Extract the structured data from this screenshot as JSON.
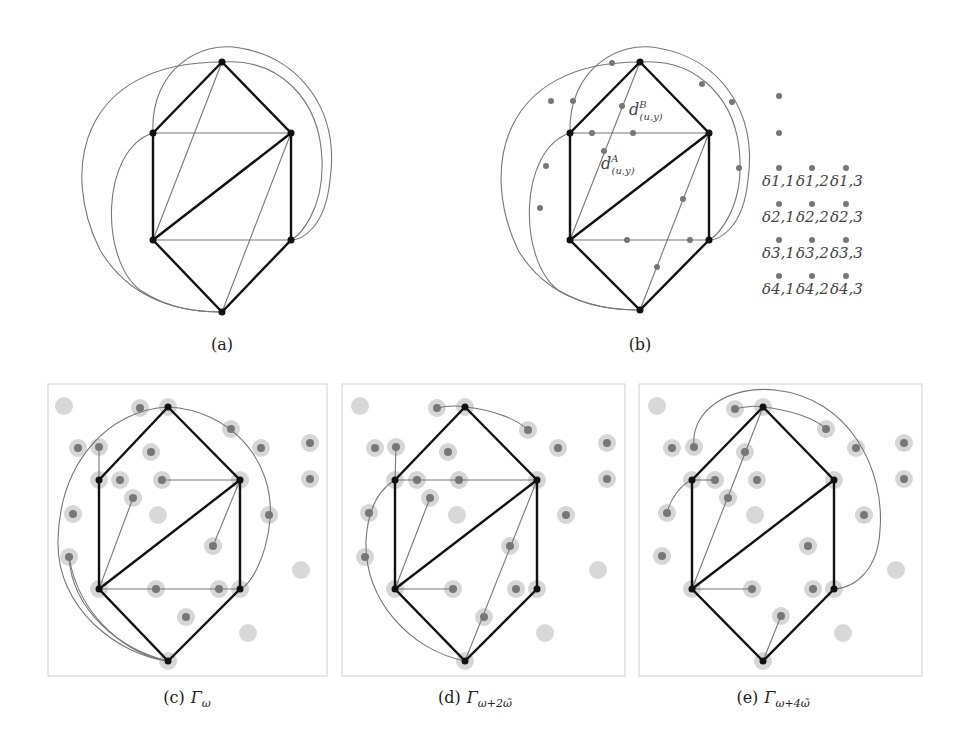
{
  "figure": {
    "panels": [
      {
        "id": "a",
        "caption": "(a)"
      },
      {
        "id": "b",
        "caption": "(b)",
        "labels": {
          "dB": {
            "base": "d",
            "sup": "B",
            "sub": "(u,y)"
          },
          "dA": {
            "base": "d",
            "sup": "A",
            "sub": "(u,y)"
          }
        },
        "delta_grid": [
          [
            "δ1,1",
            "δ1,2",
            "δ1,3"
          ],
          [
            "δ2,1",
            "δ2,2",
            "δ2,3"
          ],
          [
            "δ3,1",
            "δ3,2",
            "δ3,3"
          ],
          [
            "δ4,1",
            "δ4,2",
            "δ4,3"
          ]
        ]
      },
      {
        "id": "c",
        "caption_prefix": "(c)",
        "caption_math": "Γ",
        "caption_sub": "ω"
      },
      {
        "id": "d",
        "caption_prefix": "(d)",
        "caption_math": "Γ",
        "caption_sub": "ω+2ω̃"
      },
      {
        "id": "e",
        "caption_prefix": "(e)",
        "caption_math": "Γ",
        "caption_sub": "ω+4ω̃"
      }
    ],
    "colors": {
      "thick_edge": "#111111",
      "thin_edge": "#777777",
      "vertex": "#111111",
      "subdivision_dot": "#777777",
      "halo": "#d6d6d6",
      "panel_border": "#cfcfcf"
    }
  }
}
